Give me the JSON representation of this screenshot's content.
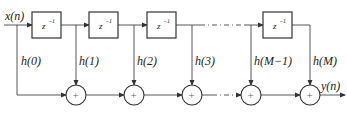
{
  "diagram": {
    "input_label": "x(n)",
    "output_label": "y(n)",
    "delay_label": "z",
    "delay_exp": "−1",
    "adder_symbol": "+",
    "coefficients": [
      "h(0)",
      "h(1)",
      "h(2)",
      "h(3)",
      "h(M−1)",
      "h(M)"
    ],
    "delays": [
      {
        "label": "z^-1"
      },
      {
        "label": "z^-1"
      },
      {
        "label": "z^-1"
      },
      {
        "label": "z^-1"
      }
    ],
    "colors": {
      "line": "#444444",
      "box": "#333333",
      "background": "#ffffff"
    }
  }
}
